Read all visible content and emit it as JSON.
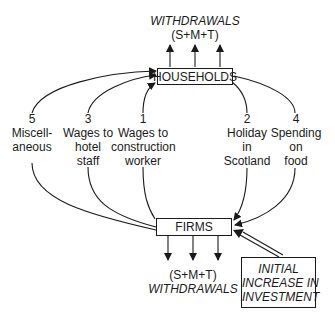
{
  "diagram": {
    "top_withdrawals": {
      "title": "WITHDRAWALS",
      "formula": "(S+M+T)"
    },
    "bottom_withdrawals": {
      "formula": "(S+M+T)",
      "title": "WITHDRAWALS"
    },
    "nodes": {
      "households": "HOUSEHOLDS",
      "firms": "FIRMS",
      "investment": {
        "line1": "INITIAL",
        "line2": "INCREASE IN",
        "line3": "INVESTMENT"
      }
    },
    "flows": [
      {
        "number": "1",
        "lines": [
          "Wages to",
          "construction",
          "worker"
        ],
        "direction": "firms-to-households"
      },
      {
        "number": "2",
        "lines": [
          "Holiday",
          "in",
          "Scotland"
        ],
        "direction": "households-to-firms"
      },
      {
        "number": "3",
        "lines": [
          "Wages to",
          "hotel",
          "staff"
        ],
        "direction": "firms-to-households"
      },
      {
        "number": "4",
        "lines": [
          "Spending",
          "on",
          "food"
        ],
        "direction": "households-to-firms"
      },
      {
        "number": "5",
        "lines": [
          "Miscell-",
          "aneous"
        ],
        "direction": "firms-to-households"
      }
    ],
    "colors": {
      "ink": "#1a1a1a",
      "background": "#ffffff"
    }
  }
}
